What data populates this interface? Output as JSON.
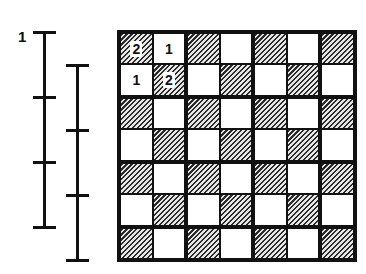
{
  "figure": {
    "label": "1",
    "scales": [
      {
        "name": "scale-left",
        "x": 44,
        "ticks_y": [
          32,
          97,
          162,
          227
        ]
      },
      {
        "name": "scale-right",
        "x": 77,
        "ticks_y": [
          65,
          130,
          195,
          260
        ]
      }
    ],
    "board": {
      "rows": 7,
      "cols": 7,
      "pattern": "checkerboard, hatched where (row+col) even",
      "numbers": [
        {
          "row": 0,
          "col": 0,
          "value": "2"
        },
        {
          "row": 0,
          "col": 1,
          "value": "1"
        },
        {
          "row": 1,
          "col": 0,
          "value": "1"
        },
        {
          "row": 1,
          "col": 1,
          "value": "2"
        }
      ]
    }
  }
}
